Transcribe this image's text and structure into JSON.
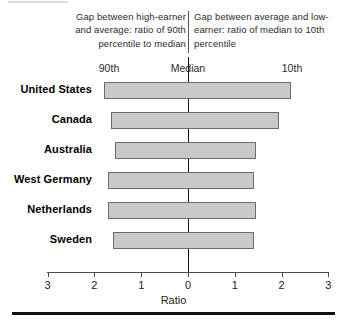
{
  "header": {
    "left_caption": "Gap between high-earner and average: ratio of 90th percentile to median",
    "right_caption": "Gap between average and low-earner: ratio of median to 10th percentile",
    "left_sublabel": "90th",
    "center_sublabel": "Median",
    "right_sublabel": "10th"
  },
  "axis": {
    "title": "Ratio",
    "tick_labels": [
      "3",
      "2",
      "1",
      "0",
      "1",
      "2",
      "3"
    ],
    "tick_values": [
      -3,
      -2,
      -1,
      0,
      1,
      2,
      3
    ]
  },
  "colors": {
    "bar_fill": "#c9c9c9",
    "bar_border": "#6b6b6b",
    "axis": "#4a4a4a",
    "median_line": "#111111",
    "text": "#1a1a1a"
  },
  "chart_data": {
    "type": "bar",
    "orientation": "horizontal",
    "title": "",
    "subtitle": "",
    "xlabel": "Ratio",
    "ylabel": "",
    "xlim": [
      -3,
      3
    ],
    "grid": false,
    "legend": "none",
    "note": "Diverging bars centered on the Median line at 0. Left extent = ratio of 90th percentile to median; right extent = ratio of median to 10th percentile. Left axis labels are plotted as positive magnitudes increasing leftward.",
    "categories": [
      "United States",
      "Canada",
      "Australia",
      "West Germany",
      "Netherlands",
      "Sweden"
    ],
    "series": [
      {
        "name": "Gap between high-earner and average: ratio of 90th percentile to median",
        "side": "left",
        "values": [
          1.8,
          1.65,
          1.55,
          1.7,
          1.7,
          1.6
        ]
      },
      {
        "name": "Gap between average and low-earner: ratio of median to 10th percentile",
        "side": "right",
        "values": [
          2.2,
          1.95,
          1.45,
          1.4,
          1.45,
          1.4
        ]
      }
    ]
  }
}
